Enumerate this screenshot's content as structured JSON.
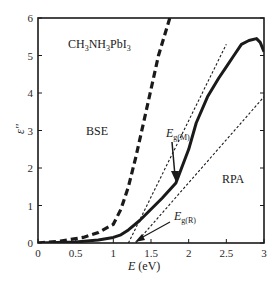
{
  "chart_data": {
    "type": "line",
    "title": "",
    "xlabel": "E (eV)",
    "ylabel": "ε''",
    "xlim": [
      0,
      3
    ],
    "ylim": [
      0,
      6
    ],
    "x_ticks": [
      "0",
      "0.5",
      "1",
      "1.5",
      "2",
      "2.5",
      "3"
    ],
    "y_ticks": [
      "0",
      "1",
      "2",
      "3",
      "4",
      "5",
      "6"
    ],
    "grid": false,
    "legend": null,
    "series": [
      {
        "name": "BSE",
        "style": "dashed-thick",
        "x": [
          0.0,
          0.3,
          0.6,
          0.8,
          1.0,
          1.1,
          1.2,
          1.3,
          1.4,
          1.5,
          1.6,
          1.75
        ],
        "y": [
          0.0,
          0.05,
          0.15,
          0.28,
          0.5,
          0.9,
          1.5,
          2.3,
          3.2,
          4.1,
          5.0,
          6.0
        ]
      },
      {
        "name": "RPA",
        "style": "solid-thick",
        "x": [
          0.0,
          0.5,
          0.8,
          1.0,
          1.1,
          1.2,
          1.35,
          1.5,
          1.65,
          1.83,
          2.0,
          2.1,
          2.25,
          2.4,
          2.5,
          2.6,
          2.7,
          2.8,
          2.9,
          2.95,
          3.0
        ],
        "y": [
          0.0,
          0.03,
          0.08,
          0.15,
          0.22,
          0.35,
          0.6,
          0.9,
          1.2,
          1.6,
          2.5,
          3.2,
          3.9,
          4.4,
          4.7,
          5.0,
          5.3,
          5.4,
          5.45,
          5.35,
          5.1
        ]
      },
      {
        "name": "Tangent (Eg(M) fit)",
        "style": "dotted",
        "x": [
          1.2,
          2.5
        ],
        "y": [
          0.0,
          5.3
        ]
      },
      {
        "name": "Tangent (Eg(R) fit)",
        "style": "dotted",
        "x": [
          1.3,
          3.0
        ],
        "y": [
          0.0,
          3.9
        ]
      }
    ],
    "annotations": [
      {
        "text": "CH3NH3PbI3",
        "x": 0.3,
        "y": 5.2
      },
      {
        "text": "BSE",
        "x": 0.55,
        "y": 3.0
      },
      {
        "text": "RPA",
        "x": 2.6,
        "y": 1.8
      },
      {
        "text": "Eg(M)",
        "x": 1.6,
        "y": 2.6,
        "arrow_to": [
          1.8,
          1.55
        ]
      },
      {
        "text": "Eg(R)",
        "x": 1.5,
        "y": 0.85,
        "arrow_to": [
          1.25,
          0.0
        ]
      }
    ]
  },
  "labels": {
    "compound_main": "CH",
    "compound_sub1": "3",
    "compound_mid": "NH",
    "compound_sub2": "3",
    "compound_end": "PbI",
    "compound_sub3": "3",
    "bse": "BSE",
    "rpa": "RPA",
    "egm_main": "E",
    "egm_sub": "g(M)",
    "egr_main": "E",
    "egr_sub": "g(R)",
    "xlabel_main": "E",
    "xlabel_unit": " (eV)",
    "ylabel": "ε''"
  }
}
